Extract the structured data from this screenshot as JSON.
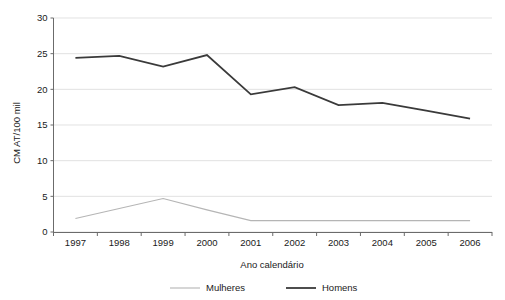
{
  "chart_data": {
    "type": "line",
    "title": "",
    "xlabel": "Ano calendário",
    "ylabel": "CM AT/100 mil",
    "categories": [
      "1997",
      "1998",
      "1999",
      "2000",
      "2001",
      "2002",
      "2003",
      "2004",
      "2005",
      "2006"
    ],
    "x": [
      1997,
      1998,
      1999,
      2000,
      2001,
      2002,
      2003,
      2004,
      2005,
      2006
    ],
    "series": [
      {
        "name": "Mulheres",
        "color": "#b5b5b5",
        "values": [
          1.9,
          3.3,
          4.7,
          3.1,
          1.6,
          1.6,
          1.6,
          1.6,
          1.6,
          1.6
        ]
      },
      {
        "name": "Homens",
        "color": "#3a3a3a",
        "values": [
          24.4,
          24.7,
          23.2,
          24.8,
          19.3,
          20.3,
          17.8,
          18.1,
          17.0,
          15.9
        ]
      }
    ],
    "ylim": [
      0,
      30
    ],
    "yticks": [
      0,
      5,
      10,
      15,
      20,
      25,
      30
    ],
    "ytick_labels": [
      "0",
      "5",
      "10",
      "15",
      "20",
      "25",
      "30"
    ],
    "grid": true,
    "grid_axis": "y",
    "legend_position": "bottom",
    "legend": [
      {
        "label": "Mulheres",
        "color": "#b5b5b5"
      },
      {
        "label": "Homens",
        "color": "#3a3a3a"
      }
    ]
  }
}
